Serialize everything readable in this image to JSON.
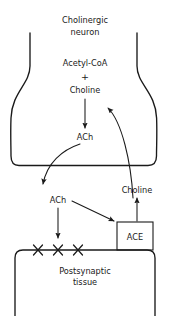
{
  "diagram": {
    "title": "Cholinergic neuron",
    "title_line1": "Cholinergic",
    "title_line2": "neuron",
    "labels": {
      "acetyl_coa": "Acetyl-CoA",
      "plus": "+",
      "choline_presynaptic": "Choline",
      "ach_presynaptic": "ACh",
      "ach_cleft": "ACh",
      "choline_cleft": "Choline",
      "ace_enzyme": "ACE",
      "postsynaptic_line1": "Postsynaptic",
      "postsynaptic_line2": "tissue"
    },
    "receptors": {
      "symbol": "x-mark",
      "count": 3
    },
    "arrows": [
      {
        "name": "synthesis-arrow",
        "from": "Choline",
        "to": "ACh",
        "style": "straight-down"
      },
      {
        "name": "release-arrow",
        "from": "ACh (presynaptic)",
        "to": "ACh (cleft)",
        "style": "curved"
      },
      {
        "name": "receptor-binding-arrow",
        "from": "ACh (cleft)",
        "to": "receptors",
        "style": "straight-down"
      },
      {
        "name": "hydrolysis-arrow",
        "from": "ACh (cleft)",
        "to": "ACE",
        "style": "diagonal"
      },
      {
        "name": "choline-release-arrow",
        "from": "ACE",
        "to": "Choline (cleft)",
        "style": "straight-up"
      },
      {
        "name": "choline-reuptake-arrow",
        "from": "Choline (cleft)",
        "to": "Choline (presynaptic)",
        "style": "curved"
      }
    ],
    "colors": {
      "stroke": "#1a1a1a",
      "background": "#ffffff",
      "text": "#1a1a1a"
    }
  }
}
